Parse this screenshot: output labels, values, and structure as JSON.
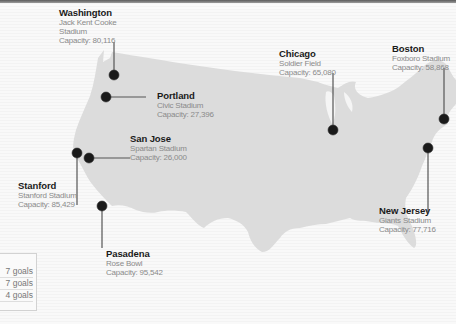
{
  "colors": {
    "land": "#dcdcdc",
    "marker": "#1a1a1a",
    "leader": "#555555",
    "city_text": "#1a1a1a",
    "detail_text": "#8a8a8a"
  },
  "venues": [
    {
      "city": "Washington",
      "stadium": "Jack Kent Cooke",
      "stadium_line2": "Stadium",
      "capacity": "Capacity: 80,116"
    },
    {
      "city": "Portland",
      "stadium": "Civic Stadium",
      "capacity": "Capacity: 27,396"
    },
    {
      "city": "San Jose",
      "stadium": "Spartan Stadium",
      "capacity": "Capacity: 26,000"
    },
    {
      "city": "Stanford",
      "stadium": "Stanford Stadium",
      "capacity": "Capacity: 85,429"
    },
    {
      "city": "Pasadena",
      "stadium": "Rose Bowl",
      "capacity": "Capacity: 95,542"
    },
    {
      "city": "Chicago",
      "stadium": "Soldier Field",
      "capacity": "Capacity: 65,080"
    },
    {
      "city": "Boston",
      "stadium": "Foxboro Stadium",
      "capacity": "Capacity: 58,868"
    },
    {
      "city": "New Jersey",
      "stadium": "Giants Stadium",
      "capacity": "Capacity: 77,716"
    }
  ],
  "goals_table": {
    "rows": [
      "7 goals",
      "7 goals",
      "4 goals"
    ]
  }
}
